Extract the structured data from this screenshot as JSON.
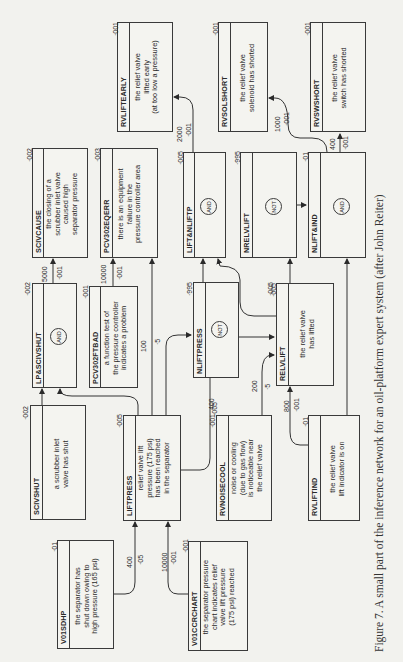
{
  "caption": "Figure 7. A small part of the inference network for an oil-platform expert system (after John Reiter)",
  "nodes": {
    "rvliftearly": {
      "name": "RVLIFTEARLY",
      "desc": [
        "the relief valve",
        "lifted early",
        "(at too low a pressure)"
      ],
      "prior": "·001"
    },
    "rvsolshort": {
      "name": "RVSOLSHORT",
      "desc": [
        "the relief valve",
        "solenoid has shorted"
      ],
      "prior": "·001"
    },
    "rvswshort": {
      "name": "RVSWSHORT",
      "desc": [
        "the relief valve",
        "switch has shorted"
      ],
      "prior": "·001"
    },
    "scivcause": {
      "name": "SCIVCAUSE",
      "desc": [
        "the closing of a",
        "scrubber inlet valve",
        "caused high",
        "separator pressure"
      ],
      "prior": "·002"
    },
    "pcv302eqerr": {
      "name": "PCV302EQERR",
      "desc": [
        "there is an equipment",
        "failure in the",
        "pressure controller area"
      ],
      "prior": "·003"
    },
    "liftnliftp": {
      "name": "LIFT&NLIFTP",
      "gate": "AND",
      "prior": "·005"
    },
    "nrelvlift": {
      "name": "NRELVLIFT",
      "gate": "NOT",
      "prior": "·995"
    },
    "nliftind": {
      "name": "NLIFT&IND",
      "gate": "AND",
      "prior": "·01"
    },
    "lpscivshut": {
      "name": "LP&SCIVSHUT",
      "gate": "AND",
      "prior": "·002"
    },
    "pcv302ftbad": {
      "name": "PCV302FTBAD",
      "desc": [
        "a function test of",
        "the pressure controller",
        "indicates a problem"
      ],
      "prior": "·001"
    },
    "nliftpress": {
      "name": "NLIFTPRESS",
      "gate": "NOT",
      "prior": "·995"
    },
    "relvlift": {
      "name": "RELVLIFT",
      "desc": [
        "the relief valve",
        "has lifted"
      ],
      "prior": "·005"
    },
    "scivshut": {
      "name": "SCIVSHUT",
      "desc": [
        "a scrubber inlet",
        "valve has shut"
      ],
      "prior": "·002"
    },
    "liftpress": {
      "name": "LIFTPRESS",
      "desc": [
        "relief valve lift",
        "pressure (175 psi)",
        "has been reached",
        "in the separator"
      ],
      "prior": "·005"
    },
    "rvnoisecool": {
      "name": "RVNOISECOOL",
      "desc": [
        "noise or cooling",
        "(due to gas flow)",
        "is noticeable near",
        "the relief valve"
      ],
      "prior": "·001"
    },
    "rvliftind": {
      "name": "RVLIFTIND",
      "desc": [
        "the relief valve",
        "lift indicator is on"
      ],
      "prior": "·01"
    },
    "v01sdhp": {
      "name": "V01SDHP",
      "desc": [
        "the separator has",
        "shut down owing to",
        "high pressure (165 psi)"
      ],
      "prior": "·01"
    },
    "v01ccrchart": {
      "name": "V01CCRCHART",
      "desc": [
        "the separator pressure",
        "chart indicates relief",
        "valve lift pressure",
        "(175 psi) reached"
      ],
      "prior": "·001"
    }
  },
  "links": {
    "liftnliftp_rvliftearly": {
      "w1": "2000",
      "w2": "·001"
    },
    "nliftind_rvsolshort": {
      "w1": "1000",
      "w2": "·001"
    },
    "nliftind_rvswshort": {
      "w1": "400",
      "w2": "·001"
    },
    "lpscivshut_scivcause": {
      "w1": "5000",
      "w2": "·001"
    },
    "pcv302ftbad_pcv302eqerr": {
      "w1": "10000",
      "w2": "·001"
    },
    "liftpress_pcv302eqerr": {
      "w1": "100",
      "w2": "·5"
    },
    "liftpress_relvlift": {
      "w1": "400",
      "w2": "·005"
    },
    "rvnoisecool_relvlift": {
      "w1": "200",
      "w2": "·5"
    },
    "rvliftind_relvlift": {
      "w1": "800",
      "w2": "·001"
    },
    "v01sdhp_liftpress": {
      "w1": "400",
      "w2": "·05"
    },
    "v01ccrchart_liftpress": {
      "w1": "10000",
      "w2": "·001"
    },
    "relvlift_nrelvlift": {
      "w1": "·005",
      "w2": ""
    }
  }
}
